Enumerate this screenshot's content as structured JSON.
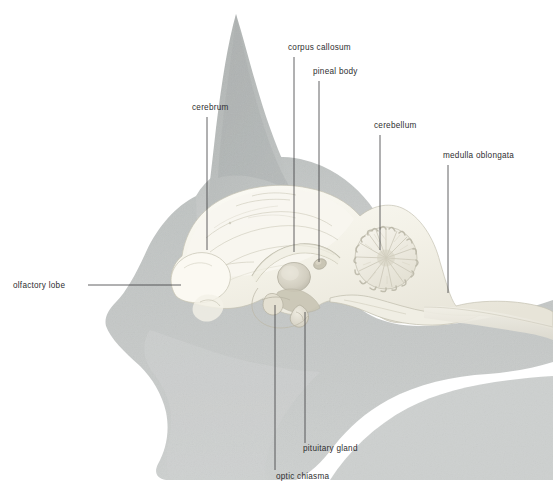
{
  "figure": {
    "background_color": "#ffffff"
  },
  "colors": {
    "silhouette_gray": "#c3c6c5",
    "silhouette_gray_dark": "#b5b9b8",
    "silhouette_gray_light": "#d4d6d5",
    "brain_cream": "#f4f2e9",
    "brain_shadow": "#e3e1d6",
    "brain_outline": "#b9b6a8",
    "leader_line": "#3a3a3c",
    "label_text": "#2e2e30"
  },
  "labels": [
    {
      "id": "cerebrum",
      "text": "cerebrum",
      "text_x": 192,
      "text_y": 110,
      "anchor": "start",
      "leader": {
        "type": "vertical",
        "x": 207,
        "y1": 117,
        "y2": 250
      }
    },
    {
      "id": "corpus-callosum",
      "text": "corpus callosum",
      "text_x": 288,
      "text_y": 50,
      "anchor": "start",
      "leader": {
        "type": "vertical",
        "x": 294,
        "y1": 57,
        "y2": 252
      }
    },
    {
      "id": "pineal-body",
      "text": "pineal body",
      "text_x": 313,
      "text_y": 74,
      "anchor": "start",
      "leader": {
        "type": "vertical",
        "x": 319,
        "y1": 81,
        "y2": 262
      }
    },
    {
      "id": "cerebellum",
      "text": "cerebellum",
      "text_x": 374,
      "text_y": 128,
      "anchor": "start",
      "leader": {
        "type": "vertical",
        "x": 380,
        "y1": 135,
        "y2": 250
      }
    },
    {
      "id": "medulla-oblongata",
      "text": "medulla oblongata",
      "text_x": 443,
      "text_y": 158,
      "anchor": "start",
      "leader": {
        "type": "vertical",
        "x": 448,
        "y1": 165,
        "y2": 293
      }
    },
    {
      "id": "olfactory-lobe",
      "text": "olfactory lobe",
      "text_x": 13,
      "text_y": 288,
      "anchor": "start",
      "leader": {
        "type": "horizontal",
        "y": 285,
        "x1": 88,
        "x2": 181
      }
    },
    {
      "id": "pituitary-gland",
      "text": "pituitary gland",
      "text_x": 303,
      "text_y": 451,
      "anchor": "start",
      "leader": {
        "type": "vertical",
        "x": 305,
        "y1": 312,
        "y2": 443
      }
    },
    {
      "id": "optic-chiasma",
      "text": "optic chiasma",
      "text_x": 276,
      "text_y": 479,
      "anchor": "start",
      "leader": {
        "type": "vertical",
        "x": 275,
        "y1": 305,
        "y2": 470
      }
    }
  ],
  "structures": [
    {
      "id": "cerebrum",
      "name": "cerebrum"
    },
    {
      "id": "corpus-callosum",
      "name": "corpus callosum"
    },
    {
      "id": "pineal-body",
      "name": "pineal body"
    },
    {
      "id": "cerebellum",
      "name": "cerebellum"
    },
    {
      "id": "medulla-oblongata",
      "name": "medulla oblongata"
    },
    {
      "id": "olfactory-lobe",
      "name": "olfactory lobe"
    },
    {
      "id": "pituitary-gland",
      "name": "pituitary gland"
    },
    {
      "id": "optic-chiasma",
      "name": "optic chiasma"
    },
    {
      "id": "thalamus",
      "name": "thalamus"
    },
    {
      "id": "spinal-cord",
      "name": "spinal cord"
    },
    {
      "id": "ear",
      "name": "ear"
    },
    {
      "id": "head-silhouette",
      "name": "head silhouette"
    }
  ]
}
